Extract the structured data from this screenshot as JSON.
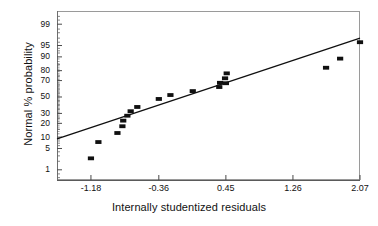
{
  "chart_data": {
    "type": "scatter",
    "title": "",
    "subtitle": "",
    "xlabel": "Internally studentized residuals",
    "ylabel": "Normal % probability",
    "grid": false,
    "legend": null,
    "xlim": [
      -1.59,
      2.07
    ],
    "ylim_percent": [
      0.4,
      99.7
    ],
    "y_scale": "normal-probability",
    "x_ticks": [
      "-1.18",
      "-0.36",
      "0.45",
      "1.26",
      "2.07"
    ],
    "x_tick_values": [
      -1.18,
      -0.36,
      0.45,
      1.26,
      2.07
    ],
    "y_ticks": [
      "99",
      "95",
      "90",
      "80",
      "70",
      "50",
      "30",
      "20",
      "10",
      "5",
      "1"
    ],
    "y_tick_values": [
      99,
      95,
      90,
      80,
      70,
      50,
      30,
      20,
      10,
      5,
      1
    ],
    "marker": "filled-square",
    "marker_color": "#101010",
    "line_color": "#101010",
    "reference_line": {
      "label": "normal reference line",
      "x": [
        -1.59,
        2.07
      ],
      "y_percent": [
        9.0,
        97.0
      ]
    },
    "series": [
      {
        "name": "Internally studentized residuals",
        "points": [
          {
            "x": -1.18,
            "y": 2.5
          },
          {
            "x": -1.09,
            "y": 7.5
          },
          {
            "x": -0.86,
            "y": 12.5
          },
          {
            "x": -0.8,
            "y": 17.5
          },
          {
            "x": -0.79,
            "y": 22.5
          },
          {
            "x": -0.74,
            "y": 27.5
          },
          {
            "x": -0.7,
            "y": 32.5
          },
          {
            "x": -0.62,
            "y": 37.5
          },
          {
            "x": -0.36,
            "y": 47.5
          },
          {
            "x": -0.22,
            "y": 52.5
          },
          {
            "x": 0.05,
            "y": 57.5
          },
          {
            "x": 0.37,
            "y": 62.5
          },
          {
            "x": 0.38,
            "y": 67.5
          },
          {
            "x": 0.44,
            "y": 72.5
          },
          {
            "x": 0.45,
            "y": 67.0
          },
          {
            "x": 0.46,
            "y": 77.5
          },
          {
            "x": 1.66,
            "y": 82.5
          },
          {
            "x": 1.83,
            "y": 89.0
          },
          {
            "x": 2.07,
            "y": 96.0
          }
        ]
      }
    ]
  }
}
